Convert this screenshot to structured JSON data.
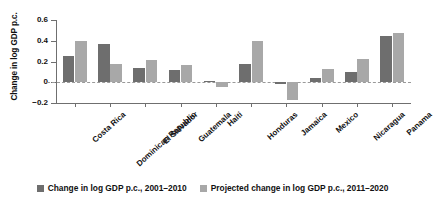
{
  "chart_data": {
    "type": "bar",
    "title": "",
    "xlabel": "",
    "ylabel": "Change in log GDP p.c.",
    "ylim": [
      -0.2,
      0.6
    ],
    "yticks": [
      0.6,
      0.4,
      0.2,
      0,
      -0.2
    ],
    "ytick_labels": [
      "0.6",
      "0.4",
      "0.2",
      "0",
      "−0.2"
    ],
    "grid": false,
    "zero_line": true,
    "legend_position": "bottom",
    "categories": [
      "Costa Rica",
      "Dominican Republic",
      "El Salvador",
      "Guatemala",
      "Haiti",
      "Honduras",
      "Jamaica",
      "Mexico",
      "Nicaragua",
      "Panama"
    ],
    "series": [
      {
        "name": "Change in log GDP p.c., 2001–2010",
        "color": "#6e6e6e",
        "values": [
          0.25,
          0.37,
          0.14,
          0.12,
          0.01,
          0.18,
          -0.02,
          0.04,
          0.1,
          0.445
        ]
      },
      {
        "name": "Projected change in log GDP p.c., 2011–2020",
        "color": "#a8a8a8",
        "values": [
          0.4,
          0.18,
          0.21,
          0.17,
          -0.05,
          0.4,
          -0.17,
          0.13,
          0.22,
          0.47
        ]
      }
    ]
  },
  "legend": {
    "items": [
      {
        "label": "Change in log GDP p.c., 2001–2010"
      },
      {
        "label": "Projected change in log GDP p.c., 2011–2020"
      }
    ]
  },
  "axis": {
    "y_title": "Change in log GDP p.c."
  }
}
